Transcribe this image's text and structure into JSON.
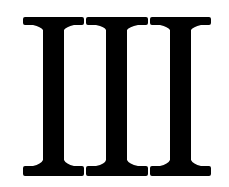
{
  "glyph": {
    "text": "III",
    "meaning": "Roman numeral three",
    "color": "#000000",
    "background": "#ffffff"
  }
}
